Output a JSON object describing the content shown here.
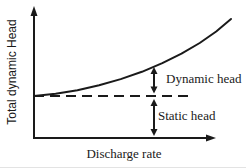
{
  "figure": {
    "background": "#ffffff",
    "ink_color": "#1a1a1a"
  },
  "labels": {
    "y_axis": "Total dynamic Head",
    "x_axis": "Discharge rate",
    "dynamic_head": "Dynamic head",
    "static_head": "Static head"
  },
  "chart_data": {
    "type": "line",
    "title": "",
    "xlabel": "Discharge rate",
    "ylabel": "Total dynamic Head",
    "axis_numeric_ticks": false,
    "grid": false,
    "legend": false,
    "series": [
      {
        "name": "system-head-curve",
        "style": "solid",
        "points_frac": [
          [
            0.0,
            0.328
          ],
          [
            0.109,
            0.345
          ],
          [
            0.219,
            0.373
          ],
          [
            0.329,
            0.412
          ],
          [
            0.438,
            0.46
          ],
          [
            0.545,
            0.517
          ],
          [
            0.648,
            0.584
          ],
          [
            0.745,
            0.659
          ],
          [
            0.837,
            0.742
          ],
          [
            0.92,
            0.832
          ],
          [
            0.995,
            0.93
          ]
        ]
      },
      {
        "name": "static-head-level",
        "style": "dashed",
        "level_frac": 0.328,
        "x_extent_frac": 0.793
      }
    ],
    "annotations": [
      {
        "label": "Dynamic head",
        "arrow_x_frac": 0.606,
        "y_from_frac": 0.348,
        "y_to_frac": 0.555
      },
      {
        "label": "Static head",
        "arrow_x_frac": 0.606,
        "y_from_frac": 0.016,
        "y_to_frac": 0.305
      }
    ]
  }
}
